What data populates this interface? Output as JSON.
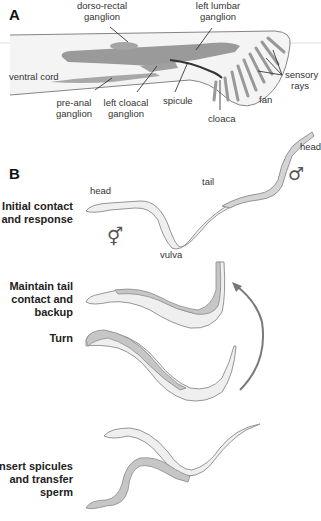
{
  "panel_a": {
    "letter": "A",
    "labels": {
      "dorso_rectal_1": "dorso-rectal",
      "dorso_rectal_2": "ganglion",
      "left_lumbar_1": "left lumbar",
      "left_lumbar_2": "ganglion",
      "ventral_cord": "ventral cord",
      "pre_anal_1": "pre-anal",
      "pre_anal_2": "ganglion",
      "left_cloacal_1": "left cloacal",
      "left_cloacal_2": "ganglion",
      "spicule": "spicule",
      "cloaca": "cloaca",
      "fan": "fan",
      "sensory_rays_1": "sensory",
      "sensory_rays_2": "rays"
    }
  },
  "panel_b": {
    "letter": "B",
    "steps": [
      {
        "line1": "Initial contact",
        "line2": "and response"
      },
      {
        "line1": "Maintain tail",
        "line2": "contact and",
        "line3": "backup"
      },
      {
        "line1": "Turn"
      },
      {
        "line1": "Insert spicules",
        "line2": "and transfer",
        "line3": "sperm"
      }
    ],
    "labels": {
      "head_herm": "head",
      "head_male": "head",
      "tail": "tail",
      "vulva": "vulva"
    },
    "symbols": {
      "hermaphrodite": "⚥",
      "male": "♂"
    }
  },
  "colors": {
    "body_fill": "#efefef",
    "outline": "#8a8a8a",
    "ganglion": "#9a9a9a",
    "male_body": "#c8c8c8",
    "arrow": "#7a7a7a"
  }
}
